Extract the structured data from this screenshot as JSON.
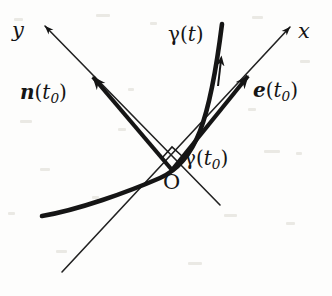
{
  "figure": {
    "kind": "geometry-diagram",
    "background_color": "#fdfdfc",
    "ink_color": "#151515"
  },
  "labels": {
    "y_axis": "y",
    "x_axis": "x",
    "curve": {
      "gamma": "γ",
      "open": "(",
      "arg": "t",
      "close": ")"
    },
    "curve_at_point": {
      "gamma": "γ",
      "open": "(",
      "arg": "t",
      "sub": "0",
      "close": ")"
    },
    "normal_vector": {
      "symbol": "n",
      "open": "(",
      "arg": "t",
      "sub": "0",
      "close": ")"
    },
    "tangent_vector": {
      "symbol": "e",
      "open": "(",
      "arg": "t",
      "sub": "0",
      "close": ")"
    },
    "origin": "O"
  },
  "geometry": {
    "origin_point": {
      "x": 172,
      "y": 170
    },
    "axes": {
      "y_axis_line": {
        "x1": 45,
        "y1": 26,
        "x2": 220,
        "y2": 205,
        "arrow_at": "start",
        "stroke_width": 1.6
      },
      "x_axis_line": {
        "x1": 290,
        "y1": 27,
        "x2": 62,
        "y2": 272,
        "arrow_at": "start",
        "stroke_width": 1.6
      }
    },
    "vectors": {
      "normal": {
        "from_x": 172,
        "from_y": 170,
        "to_x": 90,
        "to_y": 74,
        "stroke_width": 4.2
      },
      "tangent": {
        "from_x": 172,
        "from_y": 170,
        "to_x": 251,
        "to_y": 72,
        "stroke_width": 4.2
      }
    },
    "curve": {
      "path": "M 42 216 C 78 210 128 192 160 178 C 196 162 210 120 222 24",
      "stroke_width": 4.6,
      "direction_marker_at": {
        "x": 220,
        "y": 64
      }
    },
    "right_angle_marker": {
      "apex_x": 172,
      "apex_y": 170,
      "size": 22
    }
  },
  "label_positions": {
    "y_axis": {
      "left": 12,
      "top": 20
    },
    "x_axis": {
      "left": 298,
      "top": 21
    },
    "curve": {
      "left": 168,
      "top": 24
    },
    "normal": {
      "left": 20,
      "top": 82
    },
    "tangent": {
      "left": 253,
      "top": 80
    },
    "curve_point": {
      "left": 184,
      "top": 148
    },
    "origin": {
      "left": 163,
      "top": 172
    }
  }
}
